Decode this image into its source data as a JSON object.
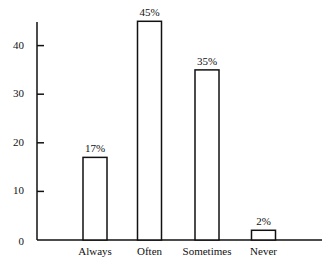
{
  "chart_data": {
    "type": "bar",
    "title": "",
    "xlabel": "",
    "ylabel": "",
    "categories": [
      "Always",
      "Often",
      "Sometimes",
      "Never"
    ],
    "values": [
      17,
      45,
      35,
      2
    ],
    "data_labels": [
      "17%",
      "45%",
      "35%",
      "2%"
    ],
    "ylim": [
      0,
      45
    ],
    "yticks": [
      0,
      10,
      20,
      30,
      40
    ],
    "ytick_labels": [
      "0",
      "10",
      "20",
      "30",
      "40"
    ],
    "grid": false,
    "legend": null,
    "bar_fill": "#ffffff",
    "bar_edge": "#111111"
  }
}
